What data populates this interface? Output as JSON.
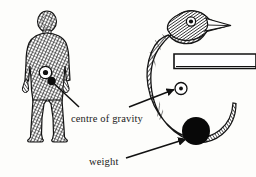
{
  "figure": {
    "background_color": "#fdfdfb",
    "ink_color": "#1a1a1a",
    "labels": {
      "centre_of_gravity": "centre of gravity",
      "weight": "weight"
    },
    "left_subject": {
      "name": "human figure",
      "description": "standing hatched human figure, front view",
      "cog_marker": "white circle with dark dot at lower abdomen"
    },
    "right_subject": {
      "name": "balancing bird toy",
      "description": "crescent-shaped hatched bird balanced on a horizontal perch",
      "cog_marker": "white circle with dark dot",
      "weight_marker": "solid black ball on tail",
      "perch": "horizontal bar extending to right edge"
    },
    "leaders": [
      {
        "label": "centre of gravity",
        "points_to": "human figure abdomen"
      },
      {
        "label": "centre of gravity",
        "points_to": "bird centre of gravity circle"
      },
      {
        "label": "weight",
        "points_to": "black ball weight on bird tail"
      }
    ]
  }
}
